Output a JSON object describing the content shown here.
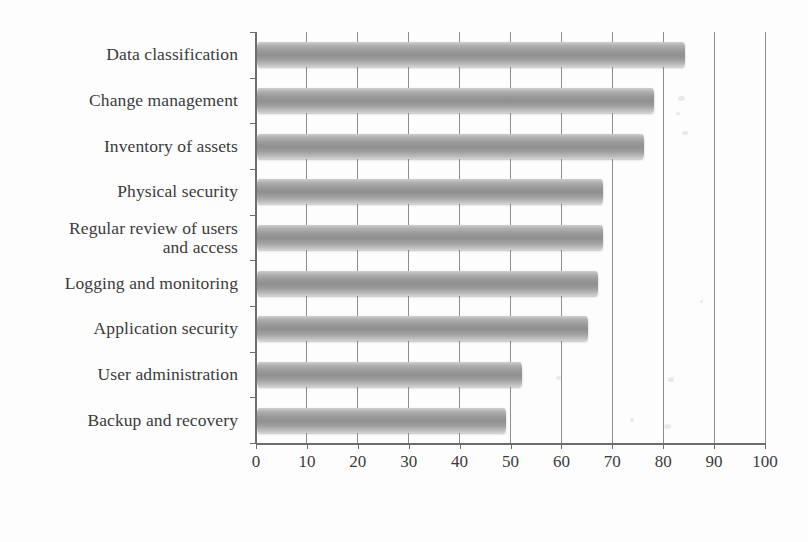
{
  "chart_data": {
    "type": "bar",
    "orientation": "horizontal",
    "title": "",
    "subtitle": "",
    "xlabel": "",
    "ylabel": "",
    "categories": [
      "Data classification",
      "Change management",
      "Inventory of assets",
      "Physical security",
      "Regular review of users and access",
      "Logging and monitoring",
      "Application security",
      "User administration",
      "Backup and recovery"
    ],
    "category_lines": [
      [
        "Data classification"
      ],
      [
        "Change management"
      ],
      [
        "Inventory of assets"
      ],
      [
        "Physical security"
      ],
      [
        "Regular review of users",
        "and access"
      ],
      [
        "Logging and monitoring"
      ],
      [
        "Application security"
      ],
      [
        "User administration"
      ],
      [
        "Backup and recovery"
      ]
    ],
    "values": [
      84,
      78,
      76,
      68,
      68,
      67,
      65,
      52,
      49
    ],
    "xlim": [
      0,
      100
    ],
    "x_ticks": [
      0,
      10,
      20,
      30,
      40,
      50,
      60,
      70,
      80,
      90,
      100
    ],
    "x_tick_labels": [
      "0",
      "10",
      "20",
      "30",
      "40",
      "50",
      "60",
      "70",
      "80",
      "90",
      "100"
    ],
    "grid": "vertical",
    "legend": "none",
    "bar_color": "#9a9a9a",
    "axis_color": "#6d6d6d",
    "text_color": "#3b3b3b",
    "background_color": "#fdfdfd"
  }
}
